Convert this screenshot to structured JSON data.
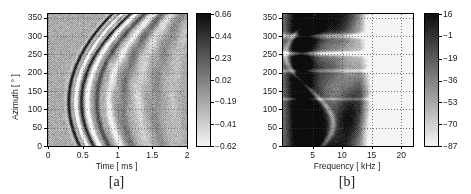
{
  "figure": {
    "width": 471,
    "height": 194,
    "background": "#ffffff",
    "foreground": "#1a1a1a"
  },
  "chart_data": [
    {
      "type": "heatmap",
      "id": "panel-a",
      "tag": "[a]",
      "title": "",
      "xlabel": "Time [ ms ]",
      "ylabel": "Azimuth [ ° ]",
      "xlim": [
        0,
        2
      ],
      "ylim": [
        0,
        360
      ],
      "xticks": [
        0,
        0.5,
        1,
        1.5,
        2
      ],
      "xticklabels": [
        "0",
        "0.5",
        "1",
        "1.5",
        "2"
      ],
      "yticks": [
        0,
        50,
        100,
        150,
        200,
        250,
        300,
        350
      ],
      "yticklabels": [
        "0",
        "50",
        "100",
        "150",
        "200",
        "250",
        "300",
        "350"
      ],
      "grid": true,
      "grid_style": "dotted",
      "colormap": "gray_inverted",
      "colorbar": {
        "position": "right",
        "vmin": -0.62,
        "vmax": 0.66,
        "ticks": [
          0.66,
          0.44,
          0.23,
          0.02,
          -0.19,
          -0.41,
          -0.62
        ],
        "ticklabels": [
          "0.66",
          "0.44",
          "0.23",
          "0.02",
          "−0.19",
          "−0.41",
          "−0.62"
        ],
        "unit": ""
      },
      "description": "Grayscale waveform record: arcing bright wavefront bands sweeping from early time at low azimuth, bending to later time near 250-350 degrees, with trailing oscillatory coda.",
      "render": {
        "mode": "wavefronts",
        "noise": 0.085,
        "dither": 0.5,
        "background_level": 0.32,
        "arrivals": [
          {
            "t0": 0.3,
            "curve": 0.26,
            "phase_center": 120,
            "phase_width": 230,
            "amp": 1.0,
            "width": 0.035,
            "polarity": 1
          },
          {
            "t0": 0.4,
            "curve": 0.3,
            "phase_center": 120,
            "phase_width": 240,
            "amp": 0.95,
            "width": 0.03,
            "polarity": -1
          },
          {
            "t0": 0.48,
            "curve": 0.32,
            "phase_center": 120,
            "phase_width": 240,
            "amp": 0.9,
            "width": 0.034,
            "polarity": 1
          },
          {
            "t0": 0.57,
            "curve": 0.33,
            "phase_center": 120,
            "phase_width": 245,
            "amp": 0.75,
            "width": 0.04,
            "polarity": -1
          },
          {
            "t0": 0.7,
            "curve": 0.34,
            "phase_center": 120,
            "phase_width": 250,
            "amp": 0.6,
            "width": 0.055,
            "polarity": 1
          },
          {
            "t0": 0.88,
            "curve": 0.33,
            "phase_center": 120,
            "phase_width": 255,
            "amp": 0.45,
            "width": 0.07,
            "polarity": -1
          },
          {
            "t0": 1.08,
            "curve": 0.3,
            "phase_center": 120,
            "phase_width": 260,
            "amp": 0.34,
            "width": 0.085,
            "polarity": 1
          },
          {
            "t0": 1.3,
            "curve": 0.26,
            "phase_center": 120,
            "phase_width": 265,
            "amp": 0.25,
            "width": 0.095,
            "polarity": -1
          },
          {
            "t0": 1.55,
            "curve": 0.22,
            "phase_center": 120,
            "phase_width": 270,
            "amp": 0.18,
            "width": 0.105,
            "polarity": 1
          },
          {
            "t0": 1.8,
            "curve": 0.18,
            "phase_center": 120,
            "phase_width": 275,
            "amp": 0.12,
            "width": 0.11,
            "polarity": -1
          }
        ]
      }
    },
    {
      "type": "heatmap",
      "id": "panel-b",
      "tag": "[b]",
      "title": "",
      "xlabel": "Frequency [ kHz ]",
      "ylabel": "",
      "xlim": [
        0,
        22
      ],
      "ylim": [
        0,
        360
      ],
      "xticks": [
        5,
        10,
        15,
        20
      ],
      "xticklabels": [
        "5",
        "10",
        "15",
        "20"
      ],
      "yticks": [
        0,
        50,
        100,
        150,
        200,
        250,
        300,
        350
      ],
      "yticklabels": [
        "0",
        "50",
        "100",
        "150",
        "200",
        "250",
        "300",
        "350"
      ],
      "grid": true,
      "grid_style": "dotted",
      "colormap": "gray_inverted",
      "colorbar": {
        "position": "right",
        "vmin": -87,
        "vmax": 16,
        "ticks": [
          16,
          -1,
          -19,
          -36,
          -53,
          -70,
          -87
        ],
        "ticklabels": [
          "16",
          "−1",
          "−19",
          "−36",
          "−53",
          "−70",
          "−87"
        ],
        "unit": "dB"
      },
      "description": "Grayscale spectral magnitude map in dB: strong low-frequency energy below 12 kHz with dark lobes near 4-8 kHz and 9-13 kHz, bright (low level) region above 16 kHz, horizontal striations near 250 and 300 degrees azimuth.",
      "render": {
        "mode": "spectrum",
        "noise": 0.06,
        "dither": 0.45,
        "lobes": [
          {
            "fc": 3.2,
            "ac": 180,
            "fw": 2.0,
            "aw": 260,
            "amp": 0.82
          },
          {
            "fc": 6.0,
            "ac": 70,
            "fw": 2.4,
            "aw": 90,
            "amp": 0.95
          },
          {
            "fc": 11.0,
            "ac": 75,
            "fw": 2.6,
            "aw": 85,
            "amp": 1.0
          },
          {
            "fc": 9.0,
            "ac": 330,
            "fw": 3.0,
            "aw": 60,
            "amp": 0.78
          },
          {
            "fc": 5.0,
            "ac": 320,
            "fw": 2.2,
            "aw": 55,
            "amp": 0.7
          },
          {
            "fc": 7.5,
            "ac": 210,
            "fw": 3.2,
            "aw": 45,
            "amp": 0.55
          },
          {
            "fc": 13.5,
            "ac": 150,
            "fw": 2.0,
            "aw": 70,
            "amp": 0.45
          }
        ],
        "rolloff_start": 13.0,
        "rolloff_rate": 0.22,
        "striations": [
          {
            "azimuth": 252,
            "width": 6,
            "amp": -0.55
          },
          {
            "azimuth": 300,
            "width": 7,
            "amp": -0.45
          },
          {
            "azimuth": 205,
            "width": 5,
            "amp": -0.3
          },
          {
            "azimuth": 128,
            "width": 4,
            "amp": -0.28
          }
        ]
      }
    }
  ],
  "layout": {
    "panel_a": {
      "plot": {
        "x": 47,
        "y": 13,
        "w": 139,
        "h": 132
      },
      "colorbar": {
        "x": 196,
        "y": 13,
        "w": 13,
        "h": 132
      },
      "xlabel_pos": {
        "x": 47,
        "y": 161,
        "w": 139
      },
      "tag_pos": {
        "x": 47,
        "y": 174,
        "w": 139
      },
      "ylabel_pos": {
        "x": 10,
        "y": 120
      }
    },
    "panel_b": {
      "plot": {
        "x": 282,
        "y": 13,
        "w": 130,
        "h": 132
      },
      "colorbar": {
        "x": 424,
        "y": 13,
        "w": 13,
        "h": 132
      },
      "xlabel_pos": {
        "x": 282,
        "y": 161,
        "w": 130
      },
      "tag_pos": {
        "x": 282,
        "y": 174,
        "w": 130
      }
    }
  }
}
